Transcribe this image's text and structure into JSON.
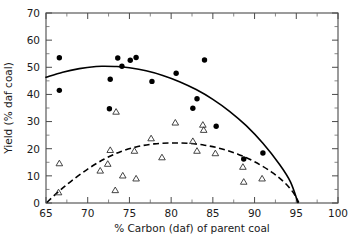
{
  "chart_data": {
    "type": "scatter",
    "title": "",
    "xlabel": "% Carbon (daf) of parent coal",
    "ylabel": "Yield (% daf coal)",
    "xlim": [
      65,
      100
    ],
    "ylim": [
      0,
      70
    ],
    "xticks": [
      65,
      70,
      75,
      80,
      85,
      90,
      95,
      100
    ],
    "xtick_labels": [
      "65",
      "70",
      "75",
      "80",
      "85",
      "90",
      "95",
      "100"
    ],
    "yticks": [
      0,
      10,
      20,
      30,
      40,
      50,
      60,
      70
    ],
    "ytick_labels": [
      "0",
      "10",
      "20",
      "30",
      "40",
      "50",
      "60",
      "70"
    ],
    "minor_xticks": [
      67.5,
      72.5,
      77.5,
      82.5,
      87.5,
      92.5,
      97.5
    ],
    "minor_yticks": [
      5,
      15,
      25,
      35,
      45,
      55,
      65
    ],
    "grid": false,
    "legend_position": "none",
    "series": [
      {
        "name": "filled-circles",
        "marker": "filled-circle",
        "color": "#000000",
        "points": [
          [
            66.6,
            53.5
          ],
          [
            66.6,
            41.5
          ],
          [
            72.7,
            45.6
          ],
          [
            72.6,
            34.7
          ],
          [
            73.6,
            53.4
          ],
          [
            74.1,
            50.4
          ],
          [
            75.1,
            52.6
          ],
          [
            75.8,
            53.6
          ],
          [
            77.7,
            44.8
          ],
          [
            80.6,
            47.8
          ],
          [
            82.6,
            34.9
          ],
          [
            83.1,
            38.4
          ],
          [
            84.0,
            52.7
          ],
          [
            85.4,
            28.3
          ],
          [
            88.7,
            16.2
          ],
          [
            91.0,
            18.4
          ]
        ]
      },
      {
        "name": "open-triangles",
        "marker": "open-triangle",
        "color": "#303030",
        "points": [
          [
            66.6,
            14.6
          ],
          [
            66.5,
            3.9
          ],
          [
            71.5,
            11.9
          ],
          [
            72.4,
            14.4
          ],
          [
            72.7,
            19.5
          ],
          [
            73.4,
            33.6
          ],
          [
            73.3,
            4.7
          ],
          [
            74.2,
            10.1
          ],
          [
            75.8,
            9.0
          ],
          [
            75.6,
            19.2
          ],
          [
            77.6,
            23.8
          ],
          [
            78.9,
            16.8
          ],
          [
            80.5,
            29.6
          ],
          [
            82.6,
            22.8
          ],
          [
            83.1,
            19.2
          ],
          [
            83.8,
            28.8
          ],
          [
            83.9,
            26.9
          ],
          [
            85.3,
            18.3
          ],
          [
            88.6,
            13.3
          ],
          [
            88.7,
            7.8
          ],
          [
            90.9,
            9.0
          ]
        ]
      }
    ],
    "curves": [
      {
        "name": "solid-fit-circles",
        "style": "solid",
        "color": "#000000",
        "points": [
          [
            65.0,
            46.3
          ],
          [
            67.0,
            48.2
          ],
          [
            69.0,
            49.5
          ],
          [
            71.0,
            50.3
          ],
          [
            72.0,
            50.4
          ],
          [
            73.5,
            50.3
          ],
          [
            75.0,
            49.8
          ],
          [
            77.0,
            48.7
          ],
          [
            79.0,
            47.0
          ],
          [
            81.0,
            44.7
          ],
          [
            83.0,
            41.8
          ],
          [
            85.0,
            38.2
          ],
          [
            87.0,
            33.8
          ],
          [
            89.0,
            28.5
          ],
          [
            91.0,
            22.0
          ],
          [
            93.0,
            14.2
          ],
          [
            94.3,
            7.8
          ],
          [
            95.2,
            0.2
          ]
        ]
      },
      {
        "name": "dashed-fit-triangles",
        "style": "dashed",
        "color": "#000000",
        "points": [
          [
            65.1,
            0.2
          ],
          [
            66.5,
            4.2
          ],
          [
            68.0,
            8.0
          ],
          [
            70.0,
            12.5
          ],
          [
            72.0,
            16.2
          ],
          [
            74.0,
            19.0
          ],
          [
            76.0,
            20.8
          ],
          [
            78.0,
            21.8
          ],
          [
            80.0,
            22.1
          ],
          [
            82.0,
            22.0
          ],
          [
            84.0,
            21.3
          ],
          [
            86.0,
            20.0
          ],
          [
            88.0,
            18.0
          ],
          [
            90.0,
            15.2
          ],
          [
            92.0,
            11.5
          ],
          [
            93.5,
            7.8
          ],
          [
            94.6,
            4.0
          ],
          [
            95.3,
            0.2
          ]
        ]
      }
    ]
  }
}
